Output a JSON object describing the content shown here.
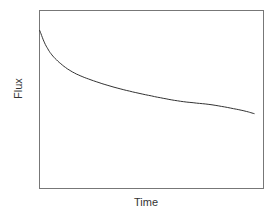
{
  "chart_data": {
    "type": "line",
    "title": "",
    "xlabel": "Time",
    "ylabel": "Flux",
    "grid": false,
    "ticks": false,
    "legend": null,
    "x": [
      0,
      0.03,
      0.07,
      0.14,
      0.23,
      0.36,
      0.5,
      0.63,
      0.77,
      0.9,
      0.96
    ],
    "series": [
      {
        "name": "Flux",
        "values": [
          0.89,
          0.8,
          0.73,
          0.66,
          0.61,
          0.56,
          0.52,
          0.49,
          0.47,
          0.44,
          0.42
        ]
      }
    ],
    "xlim": [
      0,
      1
    ],
    "ylim": [
      0,
      1
    ],
    "colors": {
      "line": "#333333",
      "axes": "#777777"
    }
  }
}
